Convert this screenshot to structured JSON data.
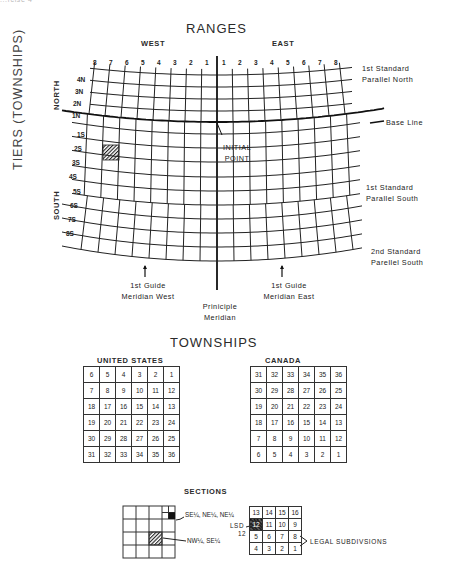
{
  "corner_fragment": "...rcise 4",
  "ranges": {
    "title": "RANGES",
    "west_label": "WEST",
    "east_label": "EAST",
    "west_numbers": [
      "8",
      "7",
      "6",
      "5",
      "4",
      "3",
      "2",
      "1"
    ],
    "east_numbers": [
      "1",
      "2",
      "3",
      "4",
      "5",
      "6",
      "7",
      "8"
    ]
  },
  "tiers": {
    "title": "TIERS (TOWNSHIPS)",
    "north_label": "NORTH",
    "south_label": "SOUTH",
    "north_numbers": [
      "4N",
      "3N",
      "2N",
      "1N"
    ],
    "south_numbers": [
      "1S",
      "2S",
      "3S",
      "4S",
      "5S",
      "6S",
      "7S",
      "8S"
    ]
  },
  "annotations": {
    "standard_parallel_north": [
      "1st Standard",
      "Parallel North"
    ],
    "base_line": "Base Line",
    "initial_point": [
      "INITIAL",
      "POINT"
    ],
    "standard_parallel_south_1": [
      "1st Standard",
      "Parallel South"
    ],
    "standard_parallel_south_2": [
      "2nd Standard",
      "Parellel South"
    ],
    "guide_meridian_west": [
      "1st Guide",
      "Meridian West"
    ],
    "guide_meridian_east": [
      "1st Guide",
      "Meridian East"
    ],
    "principal_meridian": [
      "Priniciple",
      "Meridian"
    ]
  },
  "highlighted_township": {
    "tier": "2S",
    "range": "7W"
  },
  "townships": {
    "title": "TOWNSHIPS",
    "united_states": {
      "label": "UNITED STATES",
      "rows": [
        [
          "6",
          "5",
          "4",
          "3",
          "2",
          "1"
        ],
        [
          "7",
          "8",
          "9",
          "10",
          "11",
          "12"
        ],
        [
          "18",
          "17",
          "16",
          "15",
          "14",
          "13"
        ],
        [
          "19",
          "20",
          "21",
          "22",
          "23",
          "24"
        ],
        [
          "30",
          "29",
          "28",
          "27",
          "26",
          "25"
        ],
        [
          "31",
          "32",
          "33",
          "34",
          "35",
          "36"
        ]
      ]
    },
    "canada": {
      "label": "CANADA",
      "rows": [
        [
          "31",
          "32",
          "33",
          "34",
          "35",
          "36"
        ],
        [
          "30",
          "29",
          "28",
          "27",
          "26",
          "25"
        ],
        [
          "19",
          "20",
          "21",
          "22",
          "23",
          "24"
        ],
        [
          "18",
          "17",
          "16",
          "15",
          "14",
          "13"
        ],
        [
          "7",
          "8",
          "9",
          "10",
          "11",
          "12"
        ],
        [
          "6",
          "5",
          "4",
          "3",
          "2",
          "1"
        ]
      ]
    }
  },
  "sections": {
    "title": "SECTIONS",
    "quarter_label_1": "SE¼, NE¼, NE¼",
    "quarter_label_2": "NW¼, SE¼",
    "lsd_label": "LSD",
    "lsd_number": "12",
    "legal_subdivisions_label": "LEGAL SUBDIVSIONS",
    "lsd_rows": [
      [
        "13",
        "14",
        "15",
        "16"
      ],
      [
        "12",
        "11",
        "10",
        "9"
      ],
      [
        "5",
        "6",
        "7",
        "8"
      ],
      [
        "4",
        "3",
        "2",
        "1"
      ]
    ]
  }
}
